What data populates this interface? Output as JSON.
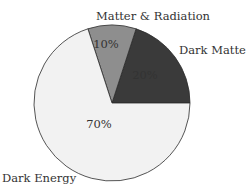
{
  "chart_data": {
    "type": "pie",
    "title": "",
    "categories": [
      "Dark Energy",
      "Dark Matter",
      "Matter & Radiation"
    ],
    "values": [
      70,
      20,
      10
    ],
    "value_labels": [
      "70%",
      "20%",
      "10%"
    ],
    "colors": [
      "#f2f2f2",
      "#3a3a3a",
      "#8e8e8e"
    ],
    "start_angle_deg": 0,
    "direction": "counterclockwise",
    "legend": "none (labels placed outside slices)"
  },
  "labels": {
    "dark_energy": "Dark Energy",
    "dark_matter": "Dark Matter",
    "matter_radiation": "Matter & Radiation",
    "pct_dark_energy": "70%",
    "pct_dark_matter": "20%",
    "pct_matter_radiation": "10%"
  }
}
